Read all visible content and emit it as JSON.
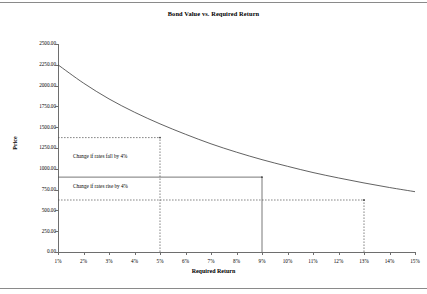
{
  "chart_data": {
    "type": "line",
    "title": "Bond Value vs. Required Return",
    "xlabel": "Required Return",
    "ylabel": "Price",
    "xlim": [
      1,
      15
    ],
    "ylim": [
      0,
      2500
    ],
    "grid": false,
    "legend": null,
    "x_tick_labels": [
      "1%",
      "2%",
      "3%",
      "4%",
      "5%",
      "6%",
      "7%",
      "8%",
      "9%",
      "10%",
      "11%",
      "12%",
      "13%",
      "14%",
      "15%"
    ],
    "x_tick_values": [
      1,
      2,
      3,
      4,
      5,
      6,
      7,
      8,
      9,
      10,
      11,
      12,
      13,
      14,
      15
    ],
    "y_tick_labels": [
      "0.00",
      "250.00",
      "500.00",
      "750.00",
      "1000.00",
      "1250.00",
      "1500.00",
      "1750.00",
      "2000.00",
      "2250.00",
      "2500.00"
    ],
    "y_tick_values": [
      0,
      250,
      500,
      750,
      1000,
      1250,
      1500,
      1750,
      2000,
      2250,
      2500
    ],
    "series": [
      {
        "name": "Bond Value",
        "x": [
          1,
          2,
          3,
          4,
          5,
          6,
          7,
          8,
          9,
          10,
          11,
          12,
          13,
          14,
          15
        ],
        "values": [
          2250,
          2030,
          1840,
          1680,
          1540,
          1415,
          1300,
          1200,
          1110,
          1030,
          955,
          890,
          830,
          775,
          725
        ]
      }
    ],
    "reference_lines": [
      {
        "name": "current-price-line",
        "orientation": "horizontal",
        "y": 900,
        "x_from": 1,
        "x_to": 9,
        "style": "solid"
      },
      {
        "name": "current-rate-line",
        "orientation": "vertical",
        "x": 9,
        "y_from": 0,
        "y_to": 900,
        "style": "solid"
      },
      {
        "name": "rates-fall-price-line",
        "orientation": "horizontal",
        "y": 1375,
        "x_from": 1,
        "x_to": 5,
        "style": "dashed"
      },
      {
        "name": "rates-fall-rate-line",
        "orientation": "vertical",
        "x": 5,
        "y_from": 0,
        "y_to": 1375,
        "style": "dashed"
      },
      {
        "name": "rates-rise-price-line",
        "orientation": "horizontal",
        "y": 625,
        "x_from": 1,
        "x_to": 13,
        "style": "dashed"
      },
      {
        "name": "rates-rise-rate-line",
        "orientation": "vertical",
        "x": 13,
        "y_from": 0,
        "y_to": 625,
        "style": "dashed"
      }
    ],
    "annotations": [
      {
        "name": "annotation-rates-fall",
        "text": "Change if rates fall by 4%",
        "x": 3.0,
        "y": 1150
      },
      {
        "name": "annotation-rates-rise",
        "text": "Change if rates rise by 4%",
        "x": 3.0,
        "y": 790
      }
    ],
    "colors": {
      "curve": "#3a3a3a",
      "axis": "#6e6e6e",
      "reference": "#555555",
      "text": "#000000",
      "background": "#ffffff"
    }
  }
}
